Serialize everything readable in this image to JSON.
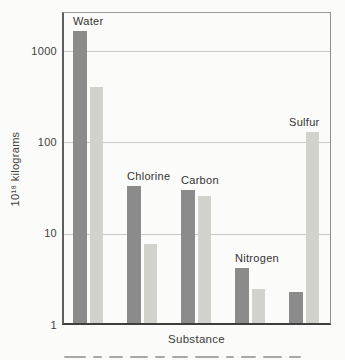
{
  "chart_data": {
    "type": "bar",
    "y_scale": "log",
    "title": "",
    "xlabel": "Substance",
    "ylabel": "10¹⁸ kilograms",
    "categories": [
      "Water",
      "Chlorine",
      "Carbon",
      "Nitrogen",
      "Sulfur"
    ],
    "series": [
      {
        "name": "dark-gray-bars",
        "color": "#8b8b8b",
        "values": [
          1650,
          33,
          30,
          4.2,
          2.3
        ]
      },
      {
        "name": "light-gray-bars",
        "color": "#d2d2cd",
        "values": [
          400,
          7.8,
          26,
          2.5,
          130
        ]
      }
    ],
    "y_ticks": [
      1,
      10,
      100,
      1000
    ],
    "ylim": [
      1,
      2700
    ],
    "grid": true,
    "legend_position": "none"
  }
}
